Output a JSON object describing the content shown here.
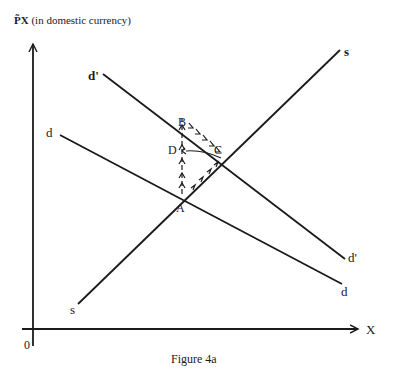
{
  "figure": {
    "caption": "Figure 4a",
    "y_axis_symbol": "P̃X",
    "y_axis_label": "(in domestic currency)",
    "x_axis_label": "X",
    "origin_label": "0"
  },
  "curves": {
    "supply": {
      "label_start": "s",
      "label_end": "s"
    },
    "demand": {
      "label_start": "d",
      "label_end": "d"
    },
    "demand_shifted": {
      "label_start": "d'",
      "label_end": "d'"
    }
  },
  "points": {
    "A": "A",
    "B": "B",
    "C": "C",
    "D": "D"
  },
  "colors": {
    "ink": "#1a1a1a",
    "background": "#ffffff"
  }
}
